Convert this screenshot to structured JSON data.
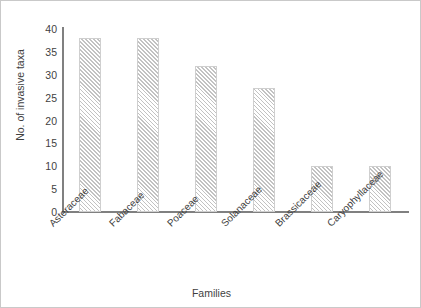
{
  "chart_data": {
    "type": "bar",
    "title": "",
    "xlabel": "Families",
    "ylabel": "No. of invasive taxa",
    "categories": [
      "Asteraceae",
      "Fabaceae",
      "Poaceae",
      "Solanaceae",
      "Brassicaceae",
      "Caryophyllaceae"
    ],
    "values": [
      38,
      38,
      32,
      27,
      10,
      10
    ],
    "ylim": [
      0,
      40
    ],
    "yticks": [
      "0",
      "5",
      "10",
      "15",
      "20",
      "25",
      "30",
      "35",
      "40"
    ],
    "ytick_values": [
      0,
      5,
      10,
      15,
      20,
      25,
      30,
      35,
      40
    ],
    "grid": false,
    "legend": null,
    "bar_fill": "#f2f2f2",
    "bar_hatch": "diagonal-lines",
    "axis_color": "#808080",
    "text_color": "#3f3f3f"
  },
  "axes": {
    "y_title": "No. of invasive taxa",
    "x_title": "Families"
  }
}
